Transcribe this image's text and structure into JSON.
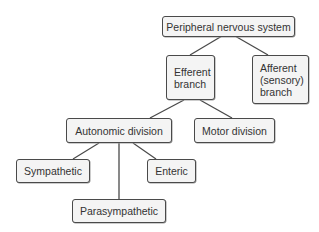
{
  "diagram": {
    "colors": {
      "line": "#4a4a4a",
      "box_fill": "#f4f4f4",
      "text": "#333333"
    },
    "nodes": {
      "pns": {
        "label": "Peripheral nervous system"
      },
      "efferent": {
        "label_lines": [
          "Efferent",
          "branch"
        ]
      },
      "afferent": {
        "label_lines": [
          "Afferent",
          "(sensory)",
          "branch"
        ]
      },
      "autonomic": {
        "label": "Autonomic division"
      },
      "motor": {
        "label": "Motor division"
      },
      "sympathetic": {
        "label": "Sympathetic"
      },
      "parasympathetic": {
        "label": "Parasympathetic"
      },
      "enteric": {
        "label": "Enteric"
      }
    },
    "edges": [
      [
        "pns",
        "efferent"
      ],
      [
        "pns",
        "afferent"
      ],
      [
        "efferent",
        "autonomic"
      ],
      [
        "efferent",
        "motor"
      ],
      [
        "autonomic",
        "sympathetic"
      ],
      [
        "autonomic",
        "parasympathetic"
      ],
      [
        "autonomic",
        "enteric"
      ]
    ]
  }
}
